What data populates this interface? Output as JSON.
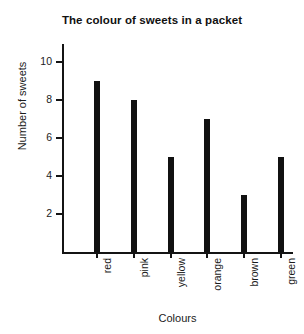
{
  "chart_data": {
    "type": "bar",
    "title": "The colour of sweets in a packet",
    "xlabel": "Colours",
    "ylabel": "Number of sweets",
    "categories": [
      "red",
      "pink",
      "yellow",
      "orange",
      "brown",
      "green"
    ],
    "values": [
      9,
      8,
      5,
      7,
      3,
      5
    ],
    "ytick_labels": [
      "2",
      "4",
      "6",
      "8",
      "10"
    ],
    "ytick_values": [
      2,
      4,
      6,
      8,
      10
    ],
    "ylim": [
      0,
      11
    ],
    "grid": false,
    "legend": false,
    "bar_color": "#111111",
    "axis_color": "#141414",
    "background_color": "#ffffff"
  }
}
